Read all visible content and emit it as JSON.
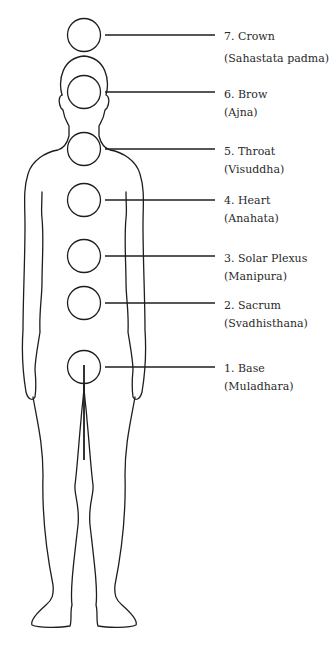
{
  "diagram": {
    "title": "",
    "colors": {
      "stroke": "#1e1e1e",
      "background": "#ffffff",
      "text": "#2a2a2a"
    },
    "chakras": [
      {
        "number": "7.",
        "name": "Crown",
        "sanskrit": "(Sahastata padma)",
        "label": "7. Crown",
        "cy": 35
      },
      {
        "number": "6.",
        "name": "Brow",
        "sanskrit": "(Ajna)",
        "label": "6. Brow",
        "cy": 92
      },
      {
        "number": "5.",
        "name": "Throat",
        "sanskrit": "(Visuddha)",
        "label": "5. Throat",
        "cy": 149
      },
      {
        "number": "4.",
        "name": "Heart",
        "sanskrit": "(Anahata)",
        "label": "4. Heart",
        "cy": 200
      },
      {
        "number": "3.",
        "name": "Solar Plexus",
        "sanskrit": "(Manipura)",
        "label": "3. Solar Plexus",
        "cy": 256
      },
      {
        "number": "2.",
        "name": "Sacrum",
        "sanskrit": "(Svadhisthana)",
        "label": "2. Sacrum",
        "cy": 303
      },
      {
        "number": "1.",
        "name": "Base",
        "sanskrit": "(Muladhara)",
        "label": "1. Base",
        "cy": 367
      }
    ]
  }
}
